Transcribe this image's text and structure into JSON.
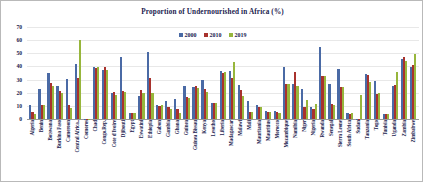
{
  "chart_data": {
    "type": "bar",
    "title": "Proportion of Undernourished in Africa (%)",
    "xlabel": "",
    "ylabel": "",
    "ylim": [
      0,
      70
    ],
    "yticks": [
      0,
      10,
      20,
      30,
      40,
      50,
      60,
      70
    ],
    "grid": true,
    "legend_position": "top-center",
    "series_colors": {
      "2000": "#4a6aa5",
      "2010": "#a8322d",
      "2019": "#97b63c"
    },
    "categories": [
      "Algeria",
      "Benin",
      "Botswana",
      "Burkina Faso",
      "Cameroon",
      "Central Africa..",
      "Comoros",
      "Chad",
      "Congo.Rep.",
      "Cote d'Ivoire",
      "Djibouti",
      "Egypt",
      "Eswatini",
      "Ethiopia",
      "Gabon",
      "Gambia",
      "Ghana",
      "Guinea",
      "Guinea Bissau",
      "Kenya",
      "Lesotho",
      "Liberia",
      "Madagascar",
      "Malawi",
      "Mali",
      "Mauritania",
      "Mauritius",
      "Morocco",
      "Mozambique",
      "Namibia",
      "Niger",
      "Nigeria",
      "Rwanda",
      "Senegal",
      "Sierra Leone",
      "South Africa",
      "Sudan",
      "Tanzania",
      "Togo",
      "Tunisia",
      "Uganda",
      "Zambia",
      "Zimbabwe"
    ],
    "series": [
      {
        "name": "2000",
        "values": [
          10.8,
          22.6,
          35.0,
          25.5,
          30.5,
          42.0,
          0,
          39.5,
          37.0,
          19.5,
          47.5,
          4.3,
          17.5,
          51.0,
          10.5,
          13.5,
          15.0,
          25.5,
          24.5,
          30.0,
          12.0,
          36.5,
          36.5,
          26.0,
          13.5,
          10.5,
          6.0,
          6.0,
          39.5,
          26.5,
          22.5,
          9.0,
          54.5,
          27.0,
          38.0,
          4.5,
          0,
          34.5,
          29.0,
          3.5,
          25.5,
          45.5,
          39.5
        ]
      },
      {
        "name": "2010",
        "values": [
          5.5,
          11.0,
          27.5,
          21.5,
          11.0,
          31.0,
          0,
          39.0,
          39.5,
          20.5,
          21.5,
          4.3,
          22.0,
          31.5,
          10.0,
          9.0,
          7.5,
          17.0,
          25.0,
          23.0,
          12.0,
          35.0,
          31.0,
          22.0,
          5.0,
          9.5,
          5.5,
          5.5,
          27.0,
          36.0,
          9.5,
          7.5,
          33.0,
          11.5,
          24.5,
          4.0,
          0,
          33.5,
          19.0,
          3.5,
          26.0,
          47.5,
          41.0
        ]
      },
      {
        "name": "2019",
        "values": [
          3.5,
          11.0,
          25.5,
          19.5,
          8.5,
          60.0,
          0,
          39.5,
          37.5,
          18.5,
          20.5,
          4.3,
          20.0,
          20.0,
          10.5,
          8.0,
          4.5,
          16.0,
          23.5,
          20.5,
          12.0,
          36.0,
          43.5,
          17.5,
          5.0,
          9.5,
          5.0,
          4.5,
          26.5,
          25.5,
          14.5,
          11.5,
          32.5,
          10.5,
          24.5,
          4.5,
          18.5,
          28.5,
          19.5,
          3.5,
          35.5,
          44.5,
          49.5
        ]
      }
    ]
  },
  "legend": {
    "entries": [
      {
        "label": "2000",
        "color": "#4a6aa5"
      },
      {
        "label": "2010",
        "color": "#a8322d"
      },
      {
        "label": "2019",
        "color": "#97b63c"
      }
    ]
  }
}
